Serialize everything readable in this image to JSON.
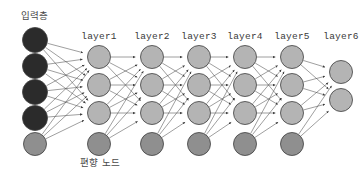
{
  "diagram": {
    "title_label": "입력층",
    "bias_label": "편향 노드",
    "background_color": "#ffffff",
    "edge_color": "#4f4f4f",
    "node_stroke_color": "#3d3d3d",
    "colors": {
      "input_node": "#2b2b2b",
      "hidden_node": "#b4b4b4",
      "bias_node": "#8f8f8f",
      "output_node": "#b4b4b4",
      "label_text": "#3a3a3a",
      "korean_text": "#4a4a4a"
    },
    "geometry": {
      "width": 364,
      "height": 177,
      "node_radius": 11.5,
      "input_radius": 12.5,
      "label_baseline_y": 39,
      "bias_label_x": 100,
      "bias_label_y": 166,
      "input_label_x": 34,
      "input_label_y": 19,
      "arrow_size": 4.2
    },
    "layers": [
      {
        "id": "input",
        "label": "",
        "kind": "input",
        "x": 35,
        "nodes": [
          {
            "y": 40,
            "type": "input"
          },
          {
            "y": 66,
            "type": "input"
          },
          {
            "y": 92,
            "type": "input"
          },
          {
            "y": 118,
            "type": "input"
          },
          {
            "y": 144,
            "type": "bias"
          }
        ]
      },
      {
        "id": "layer1",
        "label": "layer1",
        "kind": "hidden",
        "x": 99,
        "nodes": [
          {
            "y": 57,
            "type": "hidden"
          },
          {
            "y": 85,
            "type": "hidden"
          },
          {
            "y": 113,
            "type": "hidden"
          },
          {
            "y": 144,
            "type": "bias"
          }
        ]
      },
      {
        "id": "layer2",
        "label": "layer2",
        "kind": "hidden",
        "x": 152,
        "nodes": [
          {
            "y": 57,
            "type": "hidden"
          },
          {
            "y": 85,
            "type": "hidden"
          },
          {
            "y": 113,
            "type": "hidden"
          },
          {
            "y": 144,
            "type": "bias"
          }
        ]
      },
      {
        "id": "layer3",
        "label": "layer3",
        "kind": "hidden",
        "x": 199,
        "nodes": [
          {
            "y": 57,
            "type": "hidden"
          },
          {
            "y": 85,
            "type": "hidden"
          },
          {
            "y": 113,
            "type": "hidden"
          },
          {
            "y": 144,
            "type": "bias"
          }
        ]
      },
      {
        "id": "layer4",
        "label": "layer4",
        "kind": "hidden",
        "x": 245,
        "nodes": [
          {
            "y": 57,
            "type": "hidden"
          },
          {
            "y": 85,
            "type": "hidden"
          },
          {
            "y": 113,
            "type": "hidden"
          },
          {
            "y": 144,
            "type": "bias"
          }
        ]
      },
      {
        "id": "layer5",
        "label": "layer5",
        "kind": "hidden",
        "x": 292,
        "nodes": [
          {
            "y": 57,
            "type": "hidden"
          },
          {
            "y": 85,
            "type": "hidden"
          },
          {
            "y": 113,
            "type": "hidden"
          },
          {
            "y": 144,
            "type": "bias"
          }
        ]
      },
      {
        "id": "layer6",
        "label": "layer6",
        "kind": "output",
        "x": 341,
        "nodes": [
          {
            "y": 72,
            "type": "output"
          },
          {
            "y": 100,
            "type": "output"
          }
        ]
      }
    ]
  }
}
